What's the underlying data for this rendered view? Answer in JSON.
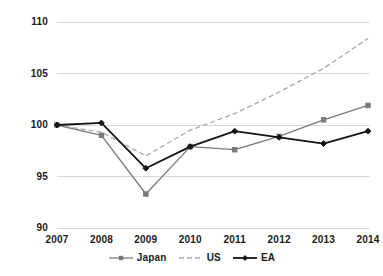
{
  "chart_data": {
    "type": "line",
    "title": "",
    "subtitle": "",
    "xlabel": "",
    "ylabel": "",
    "categories": [
      "2007",
      "2008",
      "2009",
      "2010",
      "2011",
      "2012",
      "2013",
      "2014"
    ],
    "x": [
      2007,
      2008,
      2009,
      2010,
      2011,
      2012,
      2013,
      2014
    ],
    "ylim": [
      90,
      110
    ],
    "yticks": [
      90,
      95,
      100,
      105,
      110
    ],
    "ytick_labels": [
      "90",
      "95",
      "100",
      "105",
      "110"
    ],
    "grid": true,
    "grid_axis": "y",
    "legend_position": "bottom",
    "series": [
      {
        "name": "Japan",
        "values": [
          100.0,
          99.0,
          93.3,
          97.9,
          97.6,
          98.9,
          100.5,
          101.9
        ],
        "color": "#7a7a7a",
        "style": "solid",
        "marker": "square"
      },
      {
        "name": "US",
        "values": [
          100.0,
          99.3,
          97.0,
          99.5,
          101.1,
          103.2,
          105.5,
          108.4
        ],
        "color": "#a8a8a8",
        "style": "dashed",
        "marker": "none"
      },
      {
        "name": "EA",
        "values": [
          100.0,
          100.2,
          95.8,
          97.9,
          99.4,
          98.8,
          98.2,
          99.4
        ],
        "color": "#141414",
        "style": "solid",
        "marker": "diamond"
      }
    ]
  },
  "axes": {
    "y_ticks": [
      {
        "label": "110",
        "value": 110
      },
      {
        "label": "105",
        "value": 105
      },
      {
        "label": "100",
        "value": 100
      },
      {
        "label": "95",
        "value": 95
      },
      {
        "label": "90",
        "value": 90
      }
    ],
    "x_ticks": [
      {
        "label": "2007"
      },
      {
        "label": "2008"
      },
      {
        "label": "2009"
      },
      {
        "label": "2010"
      },
      {
        "label": "2011"
      },
      {
        "label": "2012"
      },
      {
        "label": "2013"
      },
      {
        "label": "2014"
      }
    ]
  },
  "legend": {
    "items": [
      {
        "label": "Japan",
        "color": "#7a7a7a",
        "style": "solid",
        "marker": "square"
      },
      {
        "label": "US",
        "color": "#a8a8a8",
        "style": "dashed",
        "marker": "none"
      },
      {
        "label": "EA",
        "color": "#141414",
        "style": "solid",
        "marker": "diamond"
      }
    ]
  },
  "colors": {
    "background": "#ffffff",
    "gridline": "#d9d9d9",
    "text": "#1a1a1a",
    "japan": "#7a7a7a",
    "us": "#a8a8a8",
    "ea": "#141414"
  }
}
